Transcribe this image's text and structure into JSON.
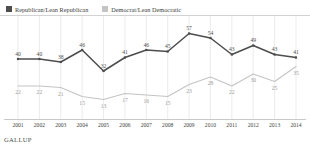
{
  "legend": {
    "entries": [
      {
        "label": "Republican/Lean Republican",
        "color": "#4d4d4d",
        "swatch_name": "republican"
      },
      {
        "label": "Democrat/Lean Democratic",
        "color": "#c4c4c4",
        "swatch_name": "democrat"
      }
    ]
  },
  "footer": {
    "brand": "GALLUP"
  },
  "chart_data": {
    "type": "line",
    "title": "",
    "subtitle": "",
    "xlabel": "",
    "ylabel": "",
    "grid": true,
    "legend_position": "top-left",
    "ylim": [
      0,
      62
    ],
    "categories": [
      "2001",
      "2002",
      "2003",
      "2004",
      "2005",
      "2006",
      "2007",
      "2008",
      "2009",
      "2010",
      "2011",
      "2012",
      "2013",
      "2014"
    ],
    "series": [
      {
        "name": "Republican/Lean Republican",
        "color": "#4d4d4d",
        "marker": "square",
        "values": [
          40,
          40,
          38,
          46,
          32,
          41,
          46,
          45,
          57,
          54,
          43,
          49,
          43,
          41
        ]
      },
      {
        "name": "Democrat/Lean Democratic",
        "color": "#c4c4c4",
        "marker": "none",
        "values": [
          22,
          22,
          21,
          15,
          13,
          17,
          16,
          15,
          23,
          28,
          22,
          30,
          25,
          35
        ]
      }
    ]
  }
}
